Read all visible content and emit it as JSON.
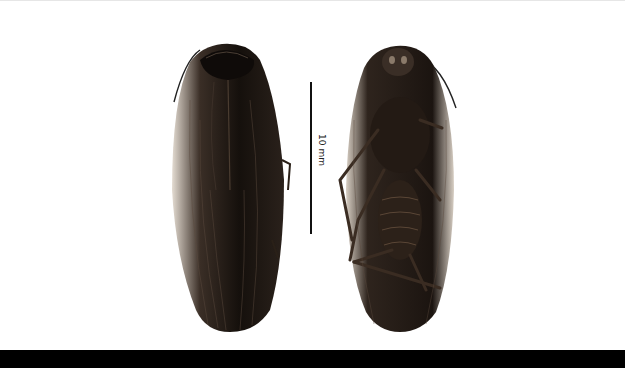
{
  "figure": {
    "scale_bar": {
      "label": "10 mm"
    },
    "specimens": [
      {
        "view": "dorsal"
      },
      {
        "view": "ventral"
      }
    ],
    "colors": {
      "background": "#ffffff",
      "bottom_bar": "#000000",
      "specimen_dark": "#1a1410",
      "specimen_margin": "#d8cfc4"
    }
  }
}
